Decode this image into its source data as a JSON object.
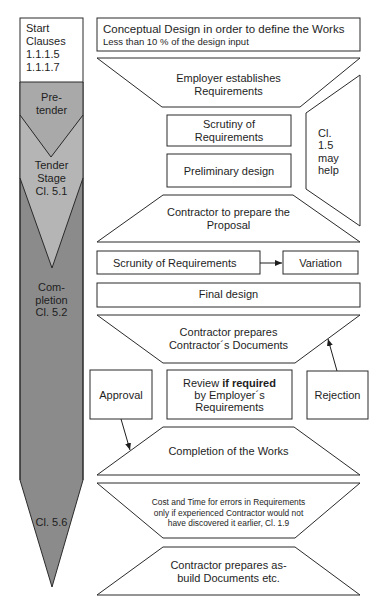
{
  "colors": {
    "column_dark": "#8b8b8b",
    "pre_tender": "#a9a9a9",
    "tender_stage": "#b5b5b5",
    "stroke": "#2a2a2a",
    "box_fill": "#ffffff"
  },
  "left_column": {
    "start": {
      "lines": [
        "Start",
        "Clauses",
        "1.1.1.5",
        "1.1.1.7"
      ]
    },
    "pre_tender": {
      "lines": [
        "Pre-",
        "tender"
      ]
    },
    "tender_stage": {
      "lines": [
        "Tender",
        "Stage",
        "Cl. 5.1"
      ]
    },
    "completion": {
      "lines": [
        "Com-",
        "pletion",
        "Cl. 5.2"
      ]
    },
    "cl_5_6": {
      "label": "Cl. 5.6"
    }
  },
  "flow": {
    "conceptual_design": {
      "title": "Conceptual Design in order to define the Works",
      "subtitle": "Less than 10 % of the design input"
    },
    "employer_requirements": {
      "lines": [
        "Employer establishes",
        "Requirements"
      ]
    },
    "scrutiny_1": {
      "lines": [
        "Scrutiny of",
        "Requirements"
      ]
    },
    "preliminary_design": {
      "label": "Preliminary design"
    },
    "cl_1_5_note": {
      "lines": [
        "Cl.",
        "1.5",
        "may",
        "help"
      ]
    },
    "proposal": {
      "lines": [
        "Contractor to prepare the",
        "Proposal"
      ]
    },
    "scrutiny_2": {
      "label": "Scrunity of Requirements"
    },
    "variation": {
      "label": "Variation"
    },
    "final_design": {
      "label": "Final design"
    },
    "contractor_documents": {
      "lines": [
        "Contractor prepares",
        "Contractor´s Documents"
      ]
    },
    "approval": {
      "label": "Approval"
    },
    "review": {
      "line1_prefix": "Review ",
      "line1_bold": "if required",
      "line2": "by Employer´s",
      "line3": "Requirements"
    },
    "rejection": {
      "label": "Rejection"
    },
    "completion_of_works": {
      "label": "Completion of the Works"
    },
    "cost_and_time": {
      "lines": [
        "Cost and Time for errors in Requirements",
        "only if experienced Contractor would not",
        "have discovered it earlier, Cl. 1.9"
      ]
    },
    "as_build": {
      "lines": [
        "Contractor prepares as-",
        "build Documents etc."
      ]
    }
  }
}
